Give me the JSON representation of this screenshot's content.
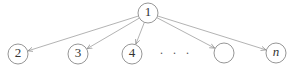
{
  "diagram": {
    "type": "tree",
    "colors": {
      "node_stroke": "#8a8a8a",
      "edge_stroke": "#a0a0a0",
      "label": "#333333",
      "background": "#ffffff"
    },
    "root": {
      "id": "1",
      "label": "1",
      "cx": 148,
      "cy": 13,
      "r": 10
    },
    "children": [
      {
        "id": "2",
        "label": "2",
        "italic": false,
        "cx": 18,
        "cy": 54,
        "r": 10
      },
      {
        "id": "3",
        "label": "3",
        "italic": false,
        "cx": 78,
        "cy": 54,
        "r": 10
      },
      {
        "id": "4",
        "label": "4",
        "italic": false,
        "cx": 132,
        "cy": 54,
        "r": 10
      },
      {
        "id": "blank",
        "label": "",
        "italic": false,
        "cx": 224,
        "cy": 53,
        "r": 10
      },
      {
        "id": "n",
        "label": "n",
        "italic": true,
        "cx": 276,
        "cy": 53,
        "r": 10
      }
    ],
    "ellipsis": {
      "label": "· · ·",
      "x": 176,
      "y": 54
    },
    "edges": [
      {
        "from": "1",
        "to": "2"
      },
      {
        "from": "1",
        "to": "3"
      },
      {
        "from": "1",
        "to": "4"
      },
      {
        "from": "1",
        "to": "blank"
      },
      {
        "from": "1",
        "to": "n"
      }
    ]
  }
}
